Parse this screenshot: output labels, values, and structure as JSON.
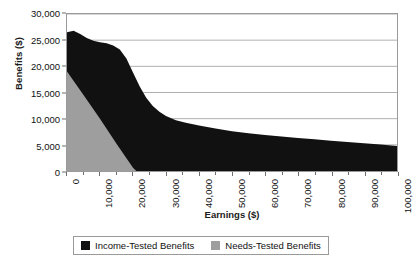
{
  "chart_data": {
    "type": "area",
    "title": "",
    "xlabel": "Earnings ($)",
    "ylabel": "Benefits ($)",
    "xlim": [
      0,
      100000
    ],
    "ylim": [
      0,
      30000
    ],
    "grid": "horizontal",
    "legend_position": "bottom",
    "ytick_labels": [
      "30,000",
      "25,000",
      "20,000",
      "15,000",
      "10,000",
      "5,000",
      "0"
    ],
    "ytick_values": [
      30000,
      25000,
      20000,
      15000,
      10000,
      5000,
      0
    ],
    "xtick_labels": [
      "0",
      "10,000",
      "20,000",
      "30,000",
      "40,000",
      "50,000",
      "60,000",
      "70,000",
      "80,000",
      "90,000",
      "100,000"
    ],
    "xtick_values": [
      0,
      10000,
      20000,
      30000,
      40000,
      50000,
      60000,
      70000,
      80000,
      90000,
      100000
    ],
    "colors": {
      "income_tested": "#111111",
      "needs_tested": "#9e9e9e",
      "gridline": "#b0b0b0",
      "axis": "#6f6f6f"
    },
    "series": [
      {
        "name": "Income-Tested Benefits",
        "color": "#111111",
        "x": [
          0,
          2000,
          4000,
          6000,
          8000,
          10000,
          12000,
          14000,
          16000,
          18000,
          20000,
          22000,
          24000,
          26000,
          28000,
          30000,
          33000,
          36000,
          40000,
          45000,
          50000,
          55000,
          60000,
          65000,
          70000,
          75000,
          80000,
          85000,
          90000,
          95000,
          100000
        ],
        "y": [
          26500,
          26800,
          26200,
          25400,
          24900,
          24600,
          24400,
          24000,
          23200,
          21500,
          18800,
          16200,
          14000,
          12400,
          11300,
          10500,
          9700,
          9200,
          8700,
          8100,
          7600,
          7200,
          6900,
          6600,
          6300,
          6050,
          5800,
          5550,
          5300,
          5050,
          4800
        ]
      },
      {
        "name": "Needs-Tested Benefits",
        "color": "#9e9e9e",
        "x": [
          0,
          5000,
          10000,
          15000,
          20000,
          21000
        ],
        "y": [
          19000,
          14500,
          10000,
          5200,
          600,
          0
        ]
      }
    ]
  },
  "legend": {
    "items": [
      {
        "label": "Income-Tested Benefits",
        "swatch": "legend-swatch-black"
      },
      {
        "label": "Needs-Tested Benefits",
        "swatch": "legend-swatch-gray"
      }
    ]
  }
}
